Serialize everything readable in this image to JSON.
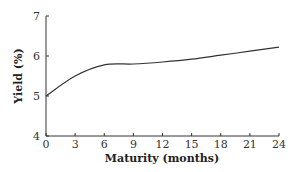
{
  "chart_data": {
    "type": "line",
    "title": "",
    "xlabel": "Maturity (months)",
    "ylabel": "Yield (%)",
    "x": [
      0,
      3,
      6,
      9,
      12,
      15,
      18,
      21,
      24
    ],
    "series": [
      {
        "name": "Yield curve",
        "values": [
          5.0,
          5.5,
          5.78,
          5.8,
          5.85,
          5.92,
          6.02,
          6.12,
          6.22
        ]
      }
    ],
    "xticks": [
      "0",
      "3",
      "6",
      "9",
      "12",
      "15",
      "18",
      "21",
      "24"
    ],
    "yticks": [
      "4",
      "5",
      "6",
      "7"
    ],
    "xlim": [
      0,
      24
    ],
    "ylim": [
      4,
      7
    ],
    "grid": false,
    "legend": null
  }
}
